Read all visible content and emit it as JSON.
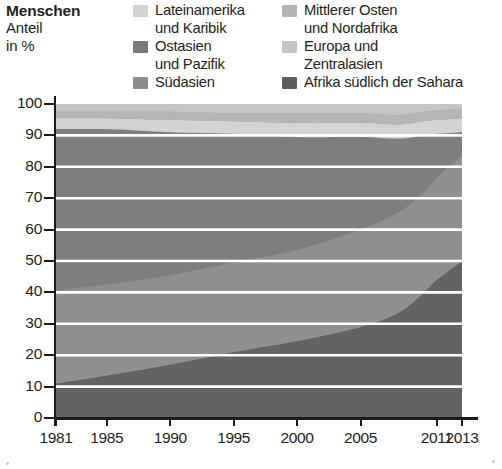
{
  "title": {
    "heading": "Menschen",
    "subline1": "Anteil",
    "subline2": "in %"
  },
  "legend": {
    "columns": [
      {
        "items": [
          {
            "label": "Lateinamerika\nund Karibik",
            "color": "#d2d2d2",
            "key": "lateinamerika"
          },
          {
            "label": "Ostasien\nund Pazifik",
            "color": "#7a7a7a",
            "key": "ostasien"
          },
          {
            "label": "Südasien",
            "color": "#8d8d8d",
            "key": "suedasien"
          }
        ]
      },
      {
        "items": [
          {
            "label": "Mittlerer Osten\nund Nordafrika",
            "color": "#b4b4b4",
            "key": "mittlerer_osten"
          },
          {
            "label": "Europa und\nZentralasien",
            "color": "#c4c4c4",
            "key": "europa"
          },
          {
            "label": "Afrika südlich der Sahara",
            "color": "#5e5e5e",
            "key": "afrika"
          }
        ]
      }
    ]
  },
  "axes": {
    "y_ticks": [
      "0",
      "10",
      "20",
      "30",
      "40",
      "50",
      "60",
      "70",
      "80",
      "90",
      "100"
    ],
    "x_ticks": [
      "1981",
      "1985",
      "1990",
      "1995",
      "2000",
      "2005",
      "2011",
      "2013"
    ]
  },
  "chart_data": {
    "type": "area",
    "stacked": true,
    "normalized_percent": true,
    "title": "Menschen",
    "subtitle": "Anteil in %",
    "xlabel": "",
    "ylabel": "Anteil in %",
    "xlim": [
      1981,
      2013
    ],
    "ylim": [
      0,
      100
    ],
    "grid": true,
    "grid_orientation": "horizontal",
    "grid_color": "#ffffff",
    "legend_position": "top",
    "x": [
      1981,
      1985,
      1990,
      1995,
      2000,
      2005,
      2008,
      2010,
      2011,
      2013
    ],
    "x_tick_values": [
      1981,
      1985,
      1990,
      1995,
      2000,
      2005,
      2011,
      2013
    ],
    "series": [
      {
        "name": "Afrika südlich der Sahara",
        "color": "#5e5e5e",
        "stack_order": 1,
        "values": [
          11.0,
          13.5,
          17.0,
          21.0,
          24.5,
          29.0,
          33.5,
          40.0,
          44.0,
          50.0
        ]
      },
      {
        "name": "Südasien",
        "color": "#8d8d8d",
        "stack_order": 2,
        "values": [
          29.5,
          29.0,
          28.5,
          28.5,
          29.0,
          31.0,
          32.0,
          32.0,
          32.5,
          33.5
        ]
      },
      {
        "name": "Ostasien und Pazifik",
        "color": "#7a7a7a",
        "stack_order": 3,
        "values": [
          51.5,
          49.5,
          45.5,
          41.0,
          36.0,
          29.5,
          23.5,
          18.0,
          14.0,
          7.5
        ]
      },
      {
        "name": "Lateinamerika und Karibik",
        "color": "#d2d2d2",
        "stack_order": 4,
        "values": [
          3.5,
          3.5,
          4.0,
          4.0,
          4.5,
          4.5,
          4.5,
          4.5,
          4.5,
          4.5
        ]
      },
      {
        "name": "Mittlerer Osten und Nordafrika",
        "color": "#b4b4b4",
        "stack_order": 5,
        "values": [
          2.0,
          2.0,
          2.5,
          2.5,
          3.0,
          3.0,
          3.0,
          3.0,
          3.0,
          3.0
        ]
      },
      {
        "name": "Europa und Zentralasien",
        "color": "#c4c4c4",
        "stack_order": 6,
        "values": [
          2.5,
          2.5,
          2.5,
          3.0,
          3.0,
          3.0,
          3.5,
          2.5,
          2.0,
          1.5
        ]
      }
    ]
  }
}
